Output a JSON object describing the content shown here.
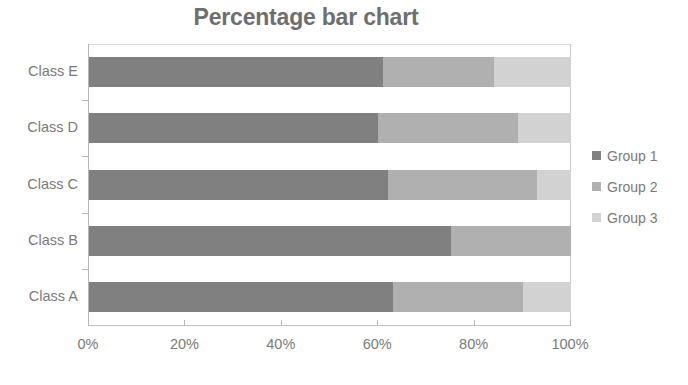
{
  "chart_data": {
    "type": "bar",
    "orientation": "horizontal",
    "stacked": true,
    "normalized": true,
    "title": "Percentage bar chart",
    "xlabel": "",
    "ylabel": "",
    "xlim": [
      0,
      100
    ],
    "grid": false,
    "legend_position": "right",
    "categories": [
      "Class A",
      "Class B",
      "Class C",
      "Class D",
      "Class E"
    ],
    "display_order_top_to_bottom": [
      "Class E",
      "Class D",
      "Class C",
      "Class B",
      "Class A"
    ],
    "x_tick_labels": [
      "0%",
      "20%",
      "40%",
      "60%",
      "80%",
      "100%"
    ],
    "x_tick_values": [
      0,
      20,
      40,
      60,
      80,
      100
    ],
    "series": [
      {
        "name": "Group 1",
        "color": "#808080",
        "values": [
          63,
          75,
          62,
          60,
          61
        ]
      },
      {
        "name": "Group 2",
        "color": "#b0b0b0",
        "values": [
          27,
          25,
          31,
          29,
          23
        ]
      },
      {
        "name": "Group 3",
        "color": "#d2d2d2",
        "values": [
          10,
          0,
          7,
          11,
          16
        ]
      }
    ],
    "rows_top_to_bottom": [
      {
        "category": "Class E",
        "segments": [
          61,
          23,
          16
        ]
      },
      {
        "category": "Class D",
        "segments": [
          60,
          29,
          11
        ]
      },
      {
        "category": "Class C",
        "segments": [
          62,
          31,
          7
        ]
      },
      {
        "category": "Class B",
        "segments": [
          75,
          25,
          0
        ]
      },
      {
        "category": "Class A",
        "segments": [
          63,
          27,
          10
        ]
      }
    ]
  },
  "legend": {
    "items": [
      {
        "label": "Group 1",
        "color": "#808080"
      },
      {
        "label": "Group 2",
        "color": "#b0b0b0"
      },
      {
        "label": "Group 3",
        "color": "#d2d2d2"
      }
    ]
  },
  "colors": {
    "title_text": "#6e6e6e",
    "axis_text": "#7a7a7a",
    "axis_line": "#b6b6b6",
    "background": "#ffffff"
  }
}
